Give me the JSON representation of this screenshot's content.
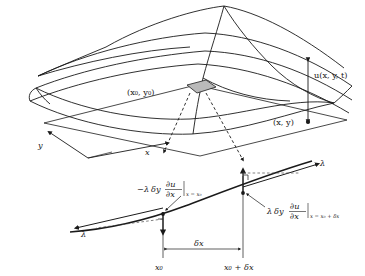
{
  "figure": {
    "colors": {
      "ink": "#1a1a1a",
      "patch_fill": "#b9b9b9",
      "background": "#ffffff",
      "dashed_guide": "#4a4a4a"
    }
  },
  "surface_panel": {
    "name": "three-dimensional membrane surface",
    "labels": {
      "point_x0y0": "(x₀, y₀)",
      "point_xy": "(x, y)",
      "displacement": "u(x, y, t)",
      "axis_x": "x",
      "axis_y": "y"
    },
    "patch_label": "shaded surface element",
    "arrow_displacement": "double-headed vertical arrow"
  },
  "cross_section_panel": {
    "name": "cross-section through the membrane",
    "left_force": {
      "sign": "−",
      "lambda": "λ",
      "delta_y": "δy",
      "partial_numerator": "∂u",
      "partial_denominator": "∂x",
      "evaluated_at": "x = x₀",
      "full": "− λδy ∂u/∂x |x = x₀"
    },
    "right_force": {
      "sign": "",
      "lambda": "λ",
      "delta_y": "δy",
      "partial_numerator": "∂u",
      "partial_denominator": "∂x",
      "evaluated_at": "x = x₀ + δx",
      "full": "λδy ∂u/∂x |x = x₀ + δx"
    },
    "tension_left_label": "λ",
    "tension_right_label": "λ",
    "span_label": "δx",
    "tick_left_label": "x₀",
    "tick_right_label": "x₀ + δx",
    "right_angle_markers": 2
  }
}
